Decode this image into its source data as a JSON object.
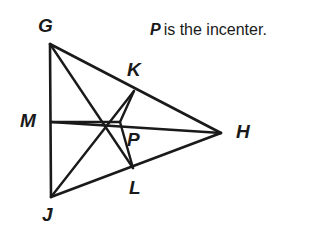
{
  "figure": {
    "kind": "geometry-diagram",
    "title_note": "Triangle with incenter and perpendicular segments to the sides",
    "stroke_color": "#1a1a1a",
    "background_color": "#ffffff",
    "caption": {
      "variable": "P",
      "text": "is the incenter."
    },
    "labels": {
      "G": "G",
      "H": "H",
      "J": "J",
      "K": "K",
      "L": "L",
      "M": "M",
      "P": "P"
    },
    "points": {
      "G": {
        "x": 50,
        "y": 44
      },
      "H": {
        "x": 221,
        "y": 133
      },
      "J": {
        "x": 51,
        "y": 197
      },
      "K": {
        "x": 134,
        "y": 91
      },
      "L": {
        "x": 133,
        "y": 168
      },
      "M": {
        "x": 51,
        "y": 122
      },
      "P": {
        "x": 120,
        "y": 122
      }
    },
    "label_positions": {
      "G": {
        "x": 38,
        "y": 16
      },
      "H": {
        "x": 236,
        "y": 122
      },
      "J": {
        "x": 42,
        "y": 205
      },
      "K": {
        "x": 127,
        "y": 60
      },
      "L": {
        "x": 129,
        "y": 178
      },
      "M": {
        "x": 20,
        "y": 111
      },
      "P": {
        "x": 127,
        "y": 130
      }
    },
    "segments": [
      {
        "name": "side-GJ",
        "from": "G",
        "to": "J"
      },
      {
        "name": "side-GH",
        "from": "G",
        "to": "H"
      },
      {
        "name": "side-JH",
        "from": "J",
        "to": "H"
      },
      {
        "name": "bisector-G-to-L",
        "from": "G",
        "to": "L"
      },
      {
        "name": "bisector-J-to-K",
        "from": "J",
        "to": "K"
      },
      {
        "name": "bisector-H-to-M",
        "from": "H",
        "to": "M"
      },
      {
        "name": "perpendicular-P-to-K",
        "from": "P",
        "to": "K"
      },
      {
        "name": "perpendicular-P-to-L",
        "from": "P",
        "to": "L"
      },
      {
        "name": "perpendicular-P-to-M",
        "from": "P",
        "to": "M"
      }
    ]
  }
}
